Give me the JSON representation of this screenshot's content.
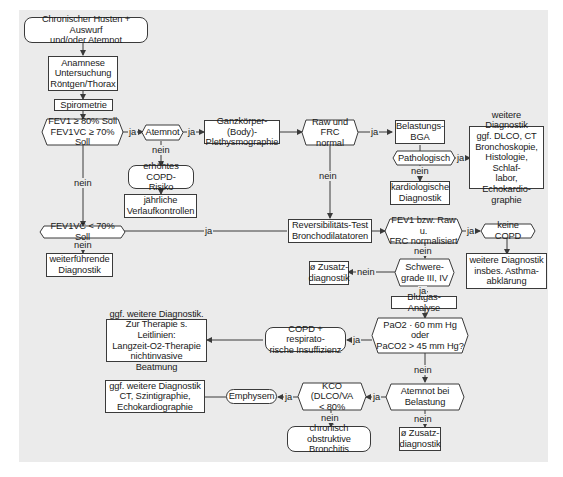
{
  "nodes": {
    "start": "Chronischer Husten + Auswurf\nund/oder Atemnot",
    "anamnese": "Anamnese\nUntersuchung\nRöntgen/Thorax",
    "spirometrie": "Spirometrie",
    "fev1_check": "FEV1 ≥ 80% Soll\nFEV1VC ≥ 70% Soll",
    "atemnot": "Atemnot",
    "erhoehtes_risiko": "erhöhtes COPD-\nRisiko",
    "jaehrliche": "jährliche\nVerlaufkontrollen",
    "ganzkoerper": "Ganzkörper-(Body)-\nPlethysmographie",
    "raw_frc": "Raw und FRC\nnormal",
    "belastungs_bga": "Belastungs-\nBGA",
    "pathologisch": "Pathologisch",
    "kardiologische": "kardiologische\nDiagnostik",
    "weitere_diag_1": "weitere Diagnostik\nggf. DLCO, CT\nBronchoskopie,\nHistologie, Schlaf-\nlabor, Echokardio-\ngraphie",
    "fev1vc_lt70": "FEV1VC < 70% Soll",
    "weiterfuehrende": "weiterführende\nDiagnostik",
    "reversibilitaet": "Reversibilitäts-Test\nBronchodilatatoren",
    "fev1_normalisiert": "FEV1 bzw. Raw u.\nFRC normalisiert",
    "keine_copd": "keine COPD",
    "weitere_diag_asthma": "weitere Diagnostik\ninsbes. Asthma-\nabklärung",
    "zusatz_1": "ø Zusatz-\ndiagnostik",
    "schweregrade": "Schwere-\ngrade III, IV",
    "blutgas": "Blutgas-Analyse",
    "pao2": "PaO2 · 60 mm Hg oder\nPaCO2 > 45 mm Hg?",
    "copd_insuff": "COPD + respirato-\nrische Insuffizienz",
    "ggf_therapie": "ggf. weitere Diagnostik.\nZur Therapie s. Leitlinien:\nLangzeit-O2-Therapie\nnichtinvasive Beatmung",
    "atemnot_belastung": "Atemnot bei\nBelastung",
    "zusatz_2": "ø Zusatz-\ndiagnostik",
    "kco": "KCO (DLCO/VA\n< 80%",
    "emphysem": "Emphysem",
    "ggf_ct": "ggf. weitere Diagnostik\nCT, Szintigraphie,\nEchokardiographie",
    "chronisch_bronchitis": "chronisch obstruktive\nBronchitis"
  },
  "labels": {
    "ja": "ja",
    "nein": "nein"
  },
  "colors": {
    "panel": "#ebebeb",
    "box_fill": "#ffffff",
    "line": "#3a3a3a"
  }
}
